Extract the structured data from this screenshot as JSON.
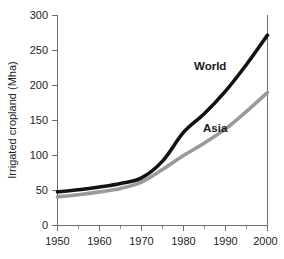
{
  "chart_data": {
    "type": "line",
    "title": "",
    "xlabel": "",
    "ylabel": "Irrigated cropland (Mha)",
    "xlim": [
      1950,
      2000
    ],
    "ylim": [
      0,
      300
    ],
    "grid": false,
    "legend_position": "inline-annotations",
    "x_ticks": [
      1950,
      1960,
      1970,
      1980,
      1990,
      2000
    ],
    "x_tick_labels": [
      "1950",
      "1960",
      "1970",
      "1980",
      "1990",
      "2000"
    ],
    "x_minor_ticks": [
      1955,
      1965,
      1975,
      1985,
      1995
    ],
    "y_ticks": [
      0,
      50,
      100,
      150,
      200,
      250,
      300
    ],
    "y_tick_labels": [
      "0",
      "50",
      "100",
      "150",
      "200",
      "250",
      "300"
    ],
    "x": [
      1950,
      1955,
      1960,
      1965,
      1970,
      1975,
      1980,
      1985,
      1990,
      1995,
      2000
    ],
    "series": [
      {
        "name": "World",
        "color": "#121212",
        "values": [
          48,
          51,
          55,
          60,
          68,
          92,
          133,
          160,
          192,
          230,
          272
        ]
      },
      {
        "name": "Asia",
        "color": "#9a9a9a",
        "values": [
          41,
          44,
          48,
          53,
          62,
          80,
          100,
          118,
          138,
          163,
          190
        ]
      }
    ],
    "annotations": [
      {
        "text": "World",
        "x": 1985,
        "y": 243
      },
      {
        "text": "Asia",
        "x": 1987,
        "y": 155
      }
    ]
  },
  "colors": {
    "background": "#ffffff",
    "axis": "#6e6e6e",
    "text": "#222222",
    "world_series": "#121212",
    "asia_series": "#9a9a9a"
  }
}
